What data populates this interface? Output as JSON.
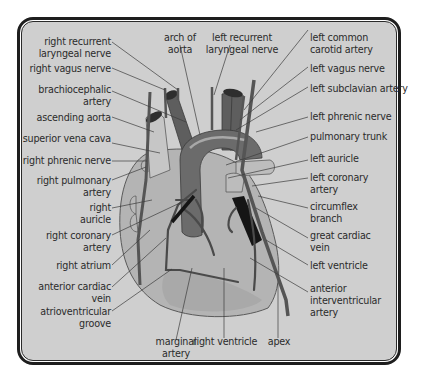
{
  "diagram": {
    "colors": {
      "panel_bg": "#cfcfcf",
      "frame": "#1e1e1e",
      "heart_body": "#b4b4b4",
      "aorta": "#6b6b6b",
      "vessels": "#4a4a4a",
      "dark_vein": "#151515",
      "label_text": "#2b2b2b"
    },
    "labels_left": [
      {
        "id": "right-recurrent-laryngeal-nerve",
        "text": "right recurrent\nlaryngeal nerve"
      },
      {
        "id": "right-vagus-nerve",
        "text": "right vagus nerve"
      },
      {
        "id": "brachiocephalic-artery",
        "text": "brachiocephalic\nartery"
      },
      {
        "id": "ascending-aorta",
        "text": "ascending aorta"
      },
      {
        "id": "superior-vena-cava",
        "text": "superior vena cava"
      },
      {
        "id": "right-phrenic-nerve",
        "text": "right phrenic nerve"
      },
      {
        "id": "right-pulmonary-artery",
        "text": "right pulmonary\nartery"
      },
      {
        "id": "right-auricle",
        "text": "right\nauricle"
      },
      {
        "id": "right-coronary-artery",
        "text": "right coronary\nartery"
      },
      {
        "id": "right-atrium",
        "text": "right atrium"
      },
      {
        "id": "anterior-cardiac-vein",
        "text": "anterior cardiac\nvein"
      },
      {
        "id": "atrioventricular-groove",
        "text": "atrioventricular\ngroove"
      }
    ],
    "labels_top": [
      {
        "id": "arch-of-aorta",
        "text": "arch of\naorta"
      },
      {
        "id": "left-recurrent-laryngeal-nerve",
        "text": "left recurrent\nlaryngeal nerve"
      }
    ],
    "labels_right": [
      {
        "id": "left-common-carotid-artery",
        "text": "left common\ncarotid artery"
      },
      {
        "id": "left-vagus-nerve",
        "text": "left vagus nerve"
      },
      {
        "id": "left-subclavian-artery",
        "text": "left subclavian artery"
      },
      {
        "id": "left-phrenic-nerve",
        "text": "left phrenic nerve"
      },
      {
        "id": "pulmonary-trunk",
        "text": "pulmonary trunk"
      },
      {
        "id": "left-auricle",
        "text": "left auricle"
      },
      {
        "id": "left-coronary-artery",
        "text": "left coronary\nartery"
      },
      {
        "id": "circumflex-branch",
        "text": "circumflex\nbranch"
      },
      {
        "id": "great-cardiac-vein",
        "text": "great cardiac\nvein"
      },
      {
        "id": "left-ventricle",
        "text": "left ventricle"
      },
      {
        "id": "anterior-interventricular-artery",
        "text": "anterior\ninterventricular\nartery"
      }
    ],
    "labels_bottom": [
      {
        "id": "marginal-artery",
        "text": "marginal\nartery"
      },
      {
        "id": "right-ventricle",
        "text": "right ventricle"
      },
      {
        "id": "apex",
        "text": "apex"
      }
    ]
  }
}
